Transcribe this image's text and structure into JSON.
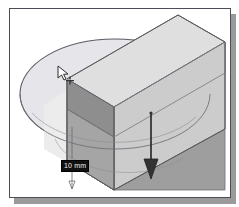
{
  "app": {
    "title": "3D CAD Extrude Preview",
    "domain_hint": "cad-viewport-screenshot"
  },
  "viewport": {
    "name": "modeling-viewport",
    "background_color": "#ffffff",
    "frame_border_color": "#4d4d57",
    "frame_shadow_color": "#9a9a9a"
  },
  "dimension": {
    "label": "10 mm",
    "value": 10,
    "unit": "mm",
    "text_color": "#f2f2f2",
    "background_color": "#111111",
    "describes": "extrusion-depth"
  },
  "cursor": {
    "name": "select-arrow-with-crosshair",
    "type": "arrow-plus",
    "fill": "#ffffff",
    "stroke": "#2b2b2b"
  },
  "extrude_arrow": {
    "name": "extrusion-direction-arrow",
    "direction": "down",
    "color": "#222222"
  },
  "geometry": {
    "solid": {
      "name": "extruded-rectangular-block",
      "faces": [
        {
          "name": "top-face",
          "color": "#e9e9e9"
        },
        {
          "name": "upper-slab-face",
          "color": "#dedede"
        },
        {
          "name": "mid-band-face",
          "color": "#b8b8b8"
        },
        {
          "name": "front-left-face",
          "color": "#8d8d8d"
        },
        {
          "name": "front-lower-face",
          "color": "#a8a8a8"
        },
        {
          "name": "right-side-face",
          "color": "#c9c9c9"
        },
        {
          "name": "bottom-shade-face",
          "color": "#9d9d9d"
        }
      ],
      "edge_color": "#5a5a5a"
    },
    "sketch": {
      "name": "circle-sketch-ellipse",
      "type": "ellipse",
      "outline_color": "#55555f",
      "fill_color": "#e4e4e8",
      "cx": 108,
      "cy": 86,
      "rx": 96,
      "ry": 55
    },
    "preview_surface": {
      "name": "extrude-preview-plane",
      "color": "#ececec"
    }
  }
}
